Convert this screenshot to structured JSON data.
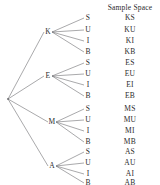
{
  "title": "Sample Space",
  "title_pos": {
    "x": 130,
    "y": 7
  },
  "root": {
    "x": 8,
    "y": 99
  },
  "colors": {
    "line": "#6f6f72",
    "text": "#2b2b2b",
    "background": "#ffffff"
  },
  "chart_data": {
    "type": "tree",
    "title": "Sample Space",
    "root_label": "",
    "level1_labels": [
      "K",
      "E",
      "M",
      "A"
    ],
    "level2_labels": [
      "S",
      "U",
      "I",
      "B"
    ],
    "outcomes": [
      "KS",
      "KU",
      "KI",
      "KB",
      "ES",
      "EU",
      "EI",
      "EB",
      "MS",
      "MU",
      "MI",
      "MB",
      "AS",
      "AU",
      "AI",
      "AB"
    ],
    "branches": 4,
    "leaves_per_branch": 4,
    "total_outcomes": 16
  },
  "nodes_level1": [
    {
      "label": "K",
      "x": 48,
      "y": 32
    },
    {
      "label": "E",
      "x": 48,
      "y": 76
    },
    {
      "label": "M",
      "x": 52,
      "y": 122
    },
    {
      "label": "A",
      "x": 52,
      "y": 166
    }
  ],
  "nodes_level2": [
    {
      "label": "S",
      "x": 88,
      "y": 18,
      "outcome": "KS",
      "ox": 130,
      "oy": 18
    },
    {
      "label": "U",
      "x": 88,
      "y": 30,
      "outcome": "KU",
      "ox": 130,
      "oy": 30
    },
    {
      "label": "I",
      "x": 88,
      "y": 41,
      "outcome": "KI",
      "ox": 130,
      "oy": 41
    },
    {
      "label": "B",
      "x": 88,
      "y": 52,
      "outcome": "KB",
      "ox": 130,
      "oy": 52
    },
    {
      "label": "S",
      "x": 88,
      "y": 63,
      "outcome": "ES",
      "ox": 130,
      "oy": 63
    },
    {
      "label": "U",
      "x": 88,
      "y": 74,
      "outcome": "EU",
      "ox": 130,
      "oy": 74
    },
    {
      "label": "I",
      "x": 88,
      "y": 85,
      "outcome": "EI",
      "ox": 130,
      "oy": 85
    },
    {
      "label": "B",
      "x": 88,
      "y": 96,
      "outcome": "EB",
      "ox": 130,
      "oy": 96
    },
    {
      "label": "S",
      "x": 88,
      "y": 109,
      "outcome": "MS",
      "ox": 130,
      "oy": 109
    },
    {
      "label": "U",
      "x": 88,
      "y": 120,
      "outcome": "MU",
      "ox": 130,
      "oy": 120
    },
    {
      "label": "I",
      "x": 88,
      "y": 131,
      "outcome": "MI",
      "ox": 130,
      "oy": 131
    },
    {
      "label": "B",
      "x": 88,
      "y": 142,
      "outcome": "MB",
      "ox": 130,
      "oy": 142
    },
    {
      "label": "S",
      "x": 88,
      "y": 152,
      "outcome": "AS",
      "ox": 130,
      "oy": 152
    },
    {
      "label": "U",
      "x": 88,
      "y": 163,
      "outcome": "AU",
      "ox": 130,
      "oy": 163
    },
    {
      "label": "I",
      "x": 88,
      "y": 174,
      "outcome": "AI",
      "ox": 130,
      "oy": 174
    },
    {
      "label": "B",
      "x": 88,
      "y": 183,
      "outcome": "AB",
      "ox": 130,
      "oy": 183
    }
  ]
}
